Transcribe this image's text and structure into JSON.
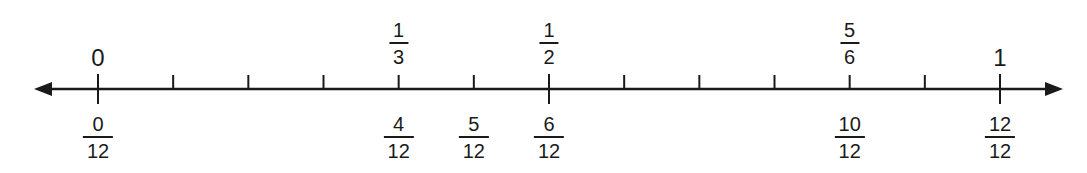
{
  "number_line": {
    "start_value": 0,
    "end_value": 1,
    "divisions": 12,
    "color": "#1a1a1a",
    "whole_labels": [
      {
        "text": "0",
        "position": 0
      },
      {
        "text": "1",
        "position": 12
      }
    ],
    "top_fraction_labels": [
      {
        "numerator": "1",
        "denominator": "3",
        "position": 4
      },
      {
        "numerator": "1",
        "denominator": "2",
        "position": 6
      },
      {
        "numerator": "5",
        "denominator": "6",
        "position": 10
      }
    ],
    "bottom_fraction_labels": [
      {
        "numerator": "0",
        "denominator": "12",
        "position": 0
      },
      {
        "numerator": "4",
        "denominator": "12",
        "position": 4
      },
      {
        "numerator": "5",
        "denominator": "12",
        "position": 5
      },
      {
        "numerator": "6",
        "denominator": "12",
        "position": 6
      },
      {
        "numerator": "10",
        "denominator": "12",
        "position": 10
      },
      {
        "numerator": "12",
        "denominator": "12",
        "position": 12
      }
    ],
    "major_tick_positions": [
      0,
      6,
      12
    ]
  }
}
